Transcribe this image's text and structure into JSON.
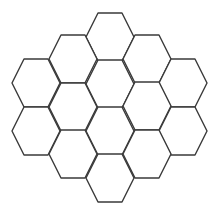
{
  "diagram": {
    "type": "hexagon-grid",
    "orientation": "flat-top",
    "stroke_color": "#3a3a3a",
    "background": "#ffffff",
    "cell_half_width": 24,
    "cell_half_height": 24,
    "cell_count": 16,
    "cells": [
      {
        "col": "C",
        "cx": 110,
        "cy": 37
      },
      {
        "col": "B",
        "cx": 73,
        "cy": 59
      },
      {
        "col": "D",
        "cx": 147,
        "cy": 59
      },
      {
        "col": "A",
        "cx": 36,
        "cy": 83
      },
      {
        "col": "C",
        "cx": 110,
        "cy": 84
      },
      {
        "col": "E",
        "cx": 183,
        "cy": 83
      },
      {
        "col": "B",
        "cx": 73,
        "cy": 107
      },
      {
        "col": "D",
        "cx": 147,
        "cy": 106
      },
      {
        "col": "A",
        "cx": 36,
        "cy": 131
      },
      {
        "col": "C",
        "cx": 110,
        "cy": 131
      },
      {
        "col": "E",
        "cx": 183,
        "cy": 131
      },
      {
        "col": "B",
        "cx": 73,
        "cy": 154
      },
      {
        "col": "D",
        "cx": 147,
        "cy": 154
      },
      {
        "col": "C",
        "cx": 110,
        "cy": 178
      }
    ]
  }
}
